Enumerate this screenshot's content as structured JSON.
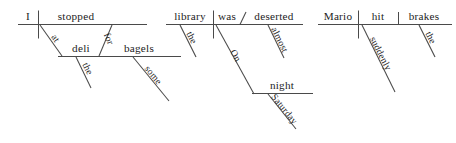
{
  "page": {
    "background_color": "#ffffff",
    "ink_color": "#1d1d1d",
    "rule_color": "#4a4a4a",
    "diagram_count": 3
  },
  "diagrams": [
    {
      "id": "diagram-1",
      "sentence": "I stopped at the deli for some bagels.",
      "subject": "I",
      "verb": "stopped",
      "words": {
        "subject": "I",
        "verb": "stopped",
        "prep1": "at",
        "object1": "deli",
        "article1": "the",
        "prep2": "for",
        "object2": "bagels",
        "modifier2": "some"
      }
    },
    {
      "id": "diagram-2",
      "sentence": "On Saturday night the library was almost deserted.",
      "subject": "library",
      "verb": "was",
      "words": {
        "article": "the",
        "subject": "library",
        "verb": "was",
        "complement": "deserted",
        "complement_mod": "almost",
        "prep": "On",
        "object": "night",
        "object_mod": "Saturday"
      }
    },
    {
      "id": "diagram-3",
      "sentence": "Mario suddenly hit the brakes.",
      "subject": "Mario",
      "verb": "hit",
      "words": {
        "subject": "Mario",
        "verb": "hit",
        "adverb": "suddenly",
        "object": "brakes",
        "article": "the"
      }
    }
  ]
}
